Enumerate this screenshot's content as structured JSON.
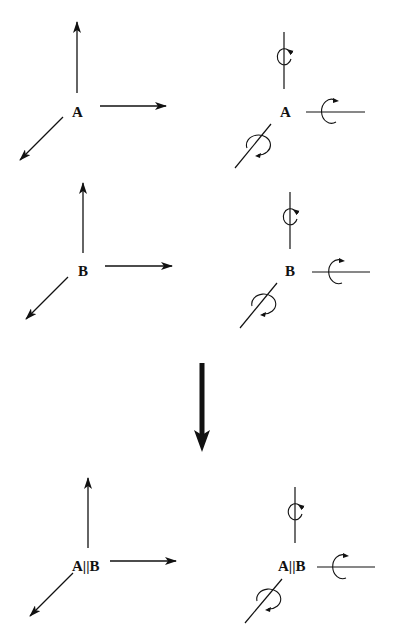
{
  "diagram": {
    "type": "symmetry-combination",
    "colors": {
      "ink": "#111111",
      "background": "#ffffff"
    },
    "rows": [
      {
        "id": "A",
        "label": "A",
        "translation": {
          "label": "A",
          "axes": [
            "up",
            "right",
            "down-left"
          ]
        },
        "rotation": {
          "label": "A",
          "axes": [
            "vertical",
            "horizontal",
            "diagonal"
          ]
        }
      },
      {
        "id": "B",
        "label": "B",
        "translation": {
          "label": "B",
          "axes": [
            "up",
            "right",
            "down-left"
          ]
        },
        "rotation": {
          "label": "B",
          "axes": [
            "vertical",
            "horizontal",
            "diagonal"
          ]
        }
      },
      {
        "id": "AB",
        "label": "A||B",
        "translation": {
          "label": "A||B",
          "axes": [
            "up",
            "right",
            "down-left"
          ]
        },
        "rotation": {
          "label": "A||B",
          "axes": [
            "vertical",
            "horizontal",
            "diagonal"
          ]
        }
      }
    ],
    "transition_arrow": {
      "direction": "down",
      "meaning": "combination"
    },
    "columns": [
      "translation",
      "rotation"
    ]
  }
}
